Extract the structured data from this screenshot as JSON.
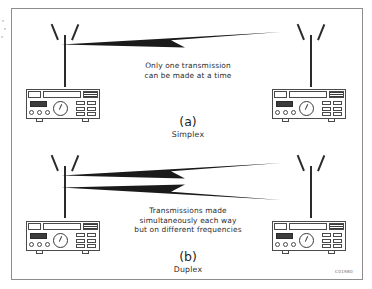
{
  "figure": {
    "code": "C01980",
    "panels": [
      {
        "id": "simplex",
        "letter": "(a)",
        "name": "Simplex",
        "caption_lines": [
          "Only one transmission",
          "can be made at a time"
        ],
        "arrows": [
          {
            "direction": "right-to-left",
            "label": "transmission-arrow"
          }
        ],
        "stations": [
          {
            "position": "left",
            "antenna": "dipole-antenna",
            "device": "radio-transceiver"
          },
          {
            "position": "right",
            "antenna": "dipole-antenna",
            "device": "radio-transceiver"
          }
        ]
      },
      {
        "id": "duplex",
        "letter": "(b)",
        "name": "Duplex",
        "caption_lines": [
          "Transmissions made",
          "simultaneously each way",
          "but on different frequencies"
        ],
        "arrows": [
          {
            "direction": "right-to-left",
            "label": "transmission-arrow-upper"
          },
          {
            "direction": "right-to-left",
            "label": "transmission-arrow-lower"
          }
        ],
        "stations": [
          {
            "position": "left",
            "antenna": "dipole-antenna",
            "device": "radio-transceiver"
          },
          {
            "position": "right",
            "antenna": "dipole-antenna",
            "device": "radio-transceiver"
          }
        ]
      }
    ]
  },
  "colors": {
    "ink": "#2b2b2b",
    "frame": "#8d8d8d",
    "display": "#3c3c3c",
    "background": "#ffffff"
  }
}
